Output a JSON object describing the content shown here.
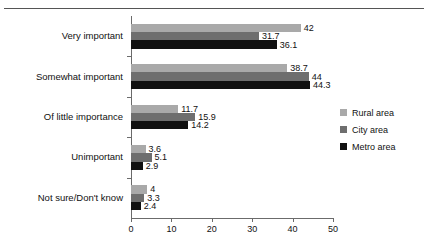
{
  "chart_data": {
    "type": "bar",
    "orientation": "horizontal",
    "title": "",
    "subtitle": "",
    "xlabel": "",
    "ylabel": "",
    "xlim": [
      0,
      50
    ],
    "xticks": [
      0,
      10,
      20,
      30,
      40,
      50
    ],
    "xtick_labels": [
      "0",
      "10",
      "20",
      "30",
      "40",
      "50"
    ],
    "grid": false,
    "legend_position": "right",
    "categories": [
      "Very important",
      "Somewhat important",
      "Of little importance",
      "Unimportant",
      "Not sure/Don't know"
    ],
    "series": [
      {
        "name": "Rural area",
        "color": "#a9a9a9",
        "values": [
          42,
          38.7,
          11.7,
          3.6,
          4
        ],
        "labels": [
          "42",
          "38.7",
          "11.7",
          "3.6",
          "4"
        ]
      },
      {
        "name": "City area",
        "color": "#6e6e6e",
        "values": [
          31.7,
          44,
          15.9,
          5.1,
          3.3
        ],
        "labels": [
          "31.7",
          "44",
          "15.9",
          "5.1",
          "3.3"
        ]
      },
      {
        "name": "Metro area",
        "color": "#111111",
        "values": [
          36.1,
          44.3,
          14.2,
          2.9,
          2.4
        ],
        "labels": [
          "36.1",
          "44.3",
          "14.2",
          "2.9",
          "2.4"
        ]
      }
    ]
  },
  "axis": {
    "tick_color": "#6b6b6b"
  },
  "legend": {
    "entries": [
      {
        "label": "Rural area",
        "color": "#a9a9a9"
      },
      {
        "label": "City area",
        "color": "#6e6e6e"
      },
      {
        "label": "Metro area",
        "color": "#111111"
      }
    ]
  }
}
